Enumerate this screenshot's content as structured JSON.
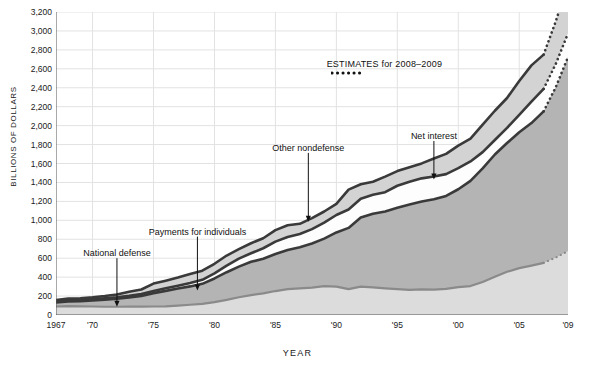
{
  "chart_data": {
    "type": "area",
    "stacked": true,
    "title": "",
    "xlabel": "YEAR",
    "ylabel": "BILLIONS OF DOLLARS",
    "xlim": [
      1967,
      2009
    ],
    "ylim": [
      0,
      3200
    ],
    "ytick_step": 200,
    "grid": true,
    "legend_position": "inline-annotations",
    "ytick_labels": [
      "0",
      "200",
      "400",
      "600",
      "800",
      "1,000",
      "1,200",
      "1,400",
      "1,600",
      "1,800",
      "2,000",
      "2,200",
      "2,400",
      "2,600",
      "2,800",
      "3,000",
      "3,200"
    ],
    "ytick_values": [
      0,
      200,
      400,
      600,
      800,
      1000,
      1200,
      1400,
      1600,
      1800,
      2000,
      2200,
      2400,
      2600,
      2800,
      3000,
      3200
    ],
    "xtick_labels": [
      "1967",
      "'70",
      "'75",
      "'80",
      "'85",
      "'90",
      "'95",
      "'00",
      "'05",
      "'09"
    ],
    "xtick_values": [
      1967,
      1970,
      1975,
      1980,
      1985,
      1990,
      1995,
      2000,
      2005,
      2009
    ],
    "x": [
      1967,
      1968,
      1969,
      1970,
      1971,
      1972,
      1973,
      1974,
      1975,
      1976,
      1977,
      1978,
      1979,
      1980,
      1981,
      1982,
      1983,
      1984,
      1985,
      1986,
      1987,
      1988,
      1989,
      1990,
      1991,
      1992,
      1993,
      1994,
      1995,
      1996,
      1997,
      1998,
      1999,
      2000,
      2001,
      2002,
      2003,
      2004,
      2005,
      2006,
      2007,
      2008,
      2009
    ],
    "estimate_years": [
      2008,
      2009
    ],
    "estimates_note": "ESTIMATES for 2008–2009",
    "series": [
      {
        "name": "National defense",
        "order": 1,
        "fill": "#dcdcdc",
        "line": "#8a8a8a",
        "values": [
          90,
          94,
          92,
          90,
          87,
          87,
          89,
          89,
          90,
          92,
          100,
          108,
          118,
          136,
          159,
          187,
          210,
          228,
          253,
          273,
          282,
          290,
          304,
          300,
          273,
          299,
          292,
          282,
          273,
          266,
          271,
          269,
          275,
          295,
          306,
          349,
          405,
          456,
          495,
          522,
          551,
          607,
          675
        ]
      },
      {
        "name": "Payments for individuals",
        "order": 2,
        "fill": "#b4b4b4",
        "line": "#3a3a3a",
        "values": [
          42,
          50,
          54,
          63,
          75,
          85,
          97,
          112,
          141,
          163,
          179,
          194,
          211,
          250,
          293,
          324,
          352,
          366,
          392,
          414,
          434,
          465,
          503,
          572,
          647,
          730,
          778,
          812,
          860,
          900,
          928,
          953,
          983,
          1033,
          1110,
          1200,
          1290,
          1360,
          1435,
          1505,
          1600,
          1800,
          2050
        ]
      },
      {
        "name": "Net interest",
        "order": 3,
        "fill": "#fdfdfd",
        "line": "#3a3a3a",
        "values": [
          10,
          11,
          12,
          14,
          15,
          15,
          17,
          21,
          23,
          27,
          30,
          35,
          43,
          53,
          69,
          85,
          90,
          111,
          130,
          136,
          139,
          152,
          169,
          184,
          194,
          199,
          199,
          203,
          232,
          241,
          244,
          241,
          230,
          223,
          206,
          171,
          153,
          160,
          184,
          227,
          237,
          245,
          250
        ]
      },
      {
        "name": "Other nondefense",
        "order": 4,
        "fill": "#d3d3d3",
        "line": "#3a3a3a",
        "values": [
          16,
          20,
          19,
          19,
          23,
          30,
          42,
          47,
          78,
          80,
          86,
          96,
          96,
          102,
          107,
          100,
          106,
          106,
          121,
          124,
          108,
          116,
          117,
          118,
          210,
          153,
          139,
          164,
          155,
          153,
          158,
          189,
          214,
          238,
          240,
          291,
          309,
          316,
          358,
          382,
          362,
          450,
          530
        ]
      }
    ],
    "annotations": [
      {
        "text": "National defense",
        "label_x": 1972.0,
        "label_y": 640,
        "arrow_from_y": 600,
        "arrow_to_x": 1972.0,
        "arrow_to_y": 88
      },
      {
        "text": "Payments for individuals",
        "label_x": 1978.6,
        "label_y": 870,
        "arrow_from_y": 828,
        "arrow_to_x": 1978.6,
        "arrow_to_y": 260
      },
      {
        "text": "Other nondefense",
        "label_x": 1987.7,
        "label_y": 1755,
        "arrow_from_y": 1712,
        "arrow_to_x": 1987.7,
        "arrow_to_y": 985
      },
      {
        "text": "Net interest",
        "label_x": 1998.0,
        "label_y": 1880,
        "arrow_from_y": 1838,
        "arrow_to_x": 1998.0,
        "arrow_to_y": 1430
      }
    ]
  }
}
